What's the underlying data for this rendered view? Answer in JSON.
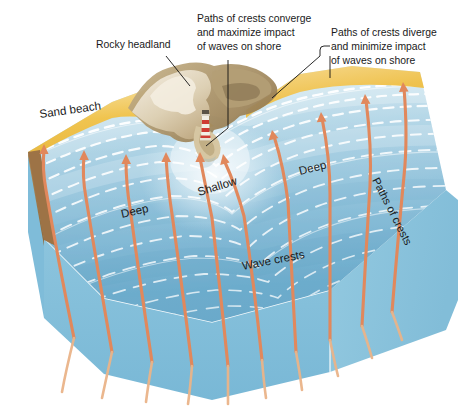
{
  "figure": {
    "type": "block-diagram"
  },
  "callouts": [
    {
      "id": "rocky-headland",
      "lines": [
        "Rocky headland"
      ],
      "x": 96,
      "y": 44,
      "anchor": "start"
    },
    {
      "id": "converge",
      "lines": [
        "Paths of crests converge",
        "and maximize impact",
        "of waves on shore"
      ],
      "x": 197,
      "y": 22,
      "anchor": "start"
    },
    {
      "id": "diverge",
      "lines": [
        "Paths of crests diverge",
        "and minimize impact",
        "of waves on shore"
      ],
      "x": 331,
      "y": 36,
      "anchor": "start"
    }
  ],
  "map_labels": [
    {
      "id": "sand-beach",
      "text": "Sand beach",
      "x": 40,
      "y": 118,
      "rotate": -8,
      "size": 11.6
    },
    {
      "id": "deep-left",
      "text": "Deep",
      "x": 122,
      "y": 218,
      "rotate": -13,
      "size": 11.6
    },
    {
      "id": "shallow",
      "text": "Shallow",
      "x": 199,
      "y": 196,
      "rotate": -17,
      "size": 11.6
    },
    {
      "id": "deep-right",
      "text": "Deep",
      "x": 300,
      "y": 175,
      "rotate": -14,
      "size": 11.6
    },
    {
      "id": "wave-crests",
      "text": "Wave crests",
      "x": 243,
      "y": 270,
      "rotate": -11,
      "size": 11.6
    },
    {
      "id": "paths-crests",
      "text": "Paths of crests",
      "x": 372,
      "y": 180,
      "rotate": 63,
      "size": 11.2
    }
  ],
  "legend_concepts": [
    "Wave crests refract and bend to align with the shoreline",
    "Energy converges on the headland",
    "Energy diverges in the bay"
  ],
  "features": {
    "headland_name": "Rocky headland",
    "lighthouse": "lighthouse-marker",
    "arrow_count": 13,
    "wave_crest_count": 13
  },
  "colors": {
    "sand": "#f0c44f",
    "sand_light": "#f6dd9a",
    "soil": "#9d7346",
    "rock_light": "#efe6d2",
    "rock_mid": "#c8b48e",
    "rock_dark": "#8e7a57",
    "water_shallow": "#dfeef6",
    "water_mid": "#a8cfe2",
    "water_deep": "#6aa9c8",
    "block_front": "#7dbbd8",
    "block_side": "#8ec7de",
    "crest": "#ffffff",
    "arrow": "#e1885c",
    "arrow_pale": "#eab489",
    "text": "#1a1a1a"
  }
}
